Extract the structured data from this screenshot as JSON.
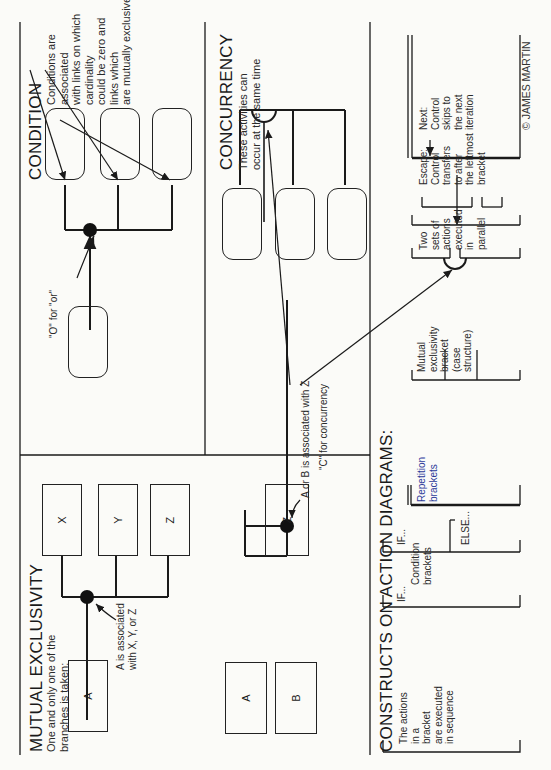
{
  "mutual_exclusivity": {
    "title": "MUTUAL EXCLUSIVITY",
    "subtitle": "One and only one of the\nbranches is taken:",
    "diagram1": {
      "source_box": "A",
      "target_boxes": [
        "X",
        "Y",
        "Z"
      ],
      "annotation": "A is associated\nwith X, Y, or Z"
    },
    "diagram2": {
      "source_boxes": [
        "A",
        "B"
      ],
      "target_box": "Z",
      "annotation": "A or B is associated with Z"
    }
  },
  "condition": {
    "title": "CONDITION",
    "description": "Conditions are associated\nwith links on which cardinality\ncould be zero and links which\nare mutually exclusive",
    "or_label": "\"O\" for \"or\""
  },
  "concurrency": {
    "title": "CONCURRENCY",
    "description": "These activities can\noccur at the same time",
    "c_label": "\"C\" for concurrency"
  },
  "constructs": {
    "title": "CONSTRUCTS ON ACTION DIAGRAMS:",
    "sequence": "The actions\nin a\nbracket\nare executed\nin sequence",
    "if1": "IF...",
    "if2": "IF...",
    "else": "ELSE...",
    "condition_brackets": "Condition\nbrackets",
    "repetition_brackets": "Repetition\nbrackets",
    "mutual_exclusivity_bracket": "Mutual\nexclusivity\nbracket\n(case\nstructure)",
    "parallel": "Two\nsets of\nactions\nexecuted\nin\nparallel",
    "escape": "Escape:\nControl\ntransfers\nto after\nthe leftmost\nbracket",
    "next": "Next:\nControl\nskips to\nthe next\niteration"
  },
  "credit": "© JAMES MARTIN",
  "colors": {
    "line": "#1a1a1a",
    "background": "#fbfbf8"
  }
}
